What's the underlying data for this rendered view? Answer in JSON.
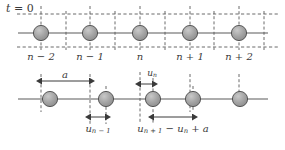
{
  "figure": {
    "colors": {
      "atom_fill": "#9e9e9e",
      "atom_stroke": "#4a4a4a",
      "axis_line": "#5a5a5a",
      "dashed_line": "#5a5a5a",
      "text": "#3a3a3a"
    },
    "lattice_constant_label": "a",
    "site_count": 5
  },
  "panel_top": {
    "time_label": {
      "var": "t",
      "eq": " = ",
      "value": "0"
    },
    "site_labels": [
      "n − 2",
      "n − 1",
      "n",
      "n + 1",
      "n + 2"
    ],
    "site_labels_parts": [
      {
        "base": "n",
        "op": " − ",
        "num": "2"
      },
      {
        "base": "n",
        "op": " − ",
        "num": "1"
      },
      {
        "base": "n",
        "op": "",
        "num": ""
      },
      {
        "base": "n",
        "op": " + ",
        "num": "1"
      },
      {
        "base": "n",
        "op": " + ",
        "num": "2"
      }
    ],
    "atom_x": [
      41,
      90,
      140,
      190,
      239
    ],
    "axis_y": 33,
    "dash_top_y": 14,
    "dash_bottom_y": 47
  },
  "panel_bottom": {
    "axis_y": 99,
    "site_x": [
      41,
      90,
      140,
      190,
      239
    ],
    "atom_x": [
      50,
      106,
      153,
      193,
      240
    ],
    "measure_a": {
      "label": "a",
      "from": 41,
      "to": 90,
      "y": 81
    },
    "measure_un": {
      "label": "u",
      "sub": "n",
      "from": 140,
      "to": 153,
      "y": 84
    },
    "measure_unm1": {
      "label": "u",
      "sub": "n − 1",
      "from": 90,
      "to": 106,
      "y": 117
    },
    "measure_spacing": {
      "label": "u",
      "sub": "n + 1",
      "op1": " − ",
      "label2": "u",
      "sub2": "n",
      "op2": " + ",
      "label3": "a",
      "from": 153,
      "to": 193,
      "y": 117
    }
  },
  "labels": {
    "a": "a",
    "u_n": "u",
    "u_n_sub": "n",
    "u_nm1": "u",
    "u_nm1_sub": "n − 1",
    "u_np1": "u",
    "u_np1_sub": "n + 1",
    "minus": " − ",
    "plus": " + "
  }
}
